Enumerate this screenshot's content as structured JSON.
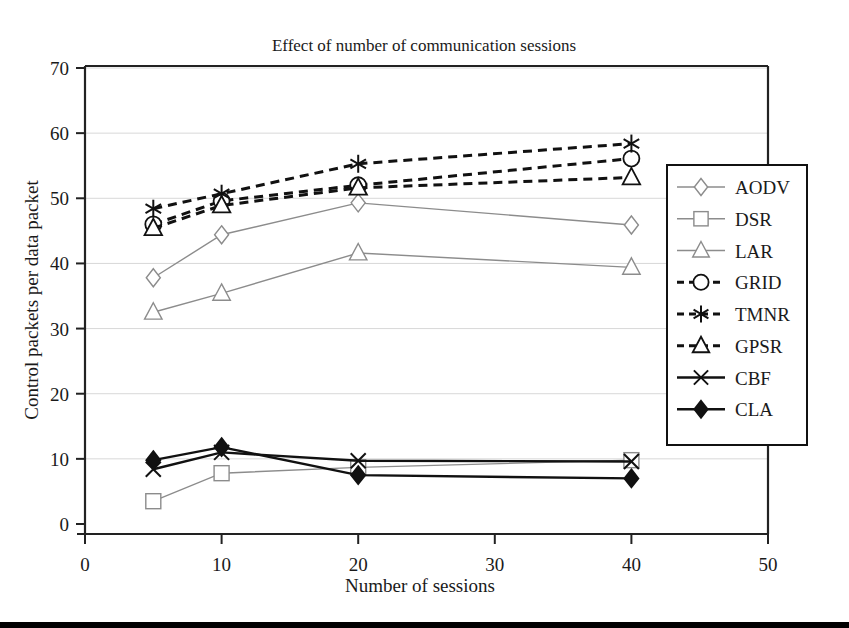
{
  "chart_data": {
    "type": "line",
    "title": "Effect of number of communication sessions",
    "xlabel": "Number of sessions",
    "ylabel": "Control packets per data packet",
    "x": [
      5,
      10,
      20,
      40
    ],
    "xlim": [
      0,
      50
    ],
    "ylim": [
      0,
      70
    ],
    "xticks": [
      "0",
      "10",
      "20",
      "30",
      "40",
      "50"
    ],
    "xtick_values": [
      0,
      10,
      20,
      30,
      40,
      50
    ],
    "yticks": [
      "0",
      "10",
      "20",
      "30",
      "40",
      "50",
      "60",
      "70"
    ],
    "ytick_values": [
      0,
      10,
      20,
      30,
      40,
      50,
      60,
      70
    ],
    "grid": "horizontal",
    "legend_position": "right",
    "series": [
      {
        "name": "AODV",
        "values": [
          37.8,
          44.4,
          49.3,
          45.9
        ],
        "style": "solid",
        "color": "#8c8c8c",
        "marker": "diamond-open"
      },
      {
        "name": "DSR",
        "values": [
          3.5,
          7.8,
          8.7,
          9.8
        ],
        "style": "solid",
        "color": "#8c8c8c",
        "marker": "square-open"
      },
      {
        "name": "LAR",
        "values": [
          32.5,
          35.4,
          41.6,
          39.4
        ],
        "style": "solid",
        "color": "#8c8c8c",
        "marker": "triangle-open"
      },
      {
        "name": "GRID",
        "values": [
          46.0,
          49.6,
          52.0,
          56.1
        ],
        "style": "dashed",
        "color": "#111111",
        "marker": "circle-open"
      },
      {
        "name": "TMNR",
        "values": [
          48.4,
          50.7,
          55.3,
          58.4
        ],
        "style": "dashed",
        "color": "#111111",
        "marker": "asterisk"
      },
      {
        "name": "GPSR",
        "values": [
          45.4,
          48.9,
          51.6,
          53.2
        ],
        "style": "dashed",
        "color": "#111111",
        "marker": "triangle-open"
      },
      {
        "name": "CBF",
        "values": [
          8.4,
          11.0,
          9.7,
          9.6
        ],
        "style": "solid",
        "color": "#111111",
        "marker": "x"
      },
      {
        "name": "CLA",
        "values": [
          9.8,
          11.8,
          7.5,
          7.0
        ],
        "style": "solid",
        "color": "#111111",
        "marker": "diamond-filled"
      }
    ]
  },
  "legend": {
    "items": [
      {
        "label": "AODV"
      },
      {
        "label": "DSR"
      },
      {
        "label": "LAR"
      },
      {
        "label": "GRID"
      },
      {
        "label": "TMNR"
      },
      {
        "label": "GPSR"
      },
      {
        "label": "CBF"
      },
      {
        "label": "CLA"
      }
    ]
  }
}
